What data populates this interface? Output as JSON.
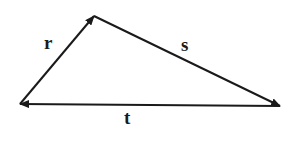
{
  "diagram": {
    "vertices": {
      "A": {
        "x": 20,
        "y": 104
      },
      "B": {
        "x": 94,
        "y": 16
      },
      "C": {
        "x": 280,
        "y": 106
      }
    },
    "vectors": [
      {
        "label": "r",
        "from": "A",
        "to": "B"
      },
      {
        "label": "s",
        "from": "B",
        "to": "C"
      },
      {
        "label": "t",
        "from": "C",
        "to": "A"
      }
    ],
    "line_color": "#1a1a1a"
  }
}
